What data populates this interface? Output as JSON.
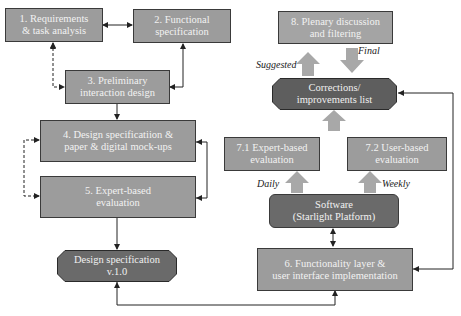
{
  "nodes": {
    "n1": {
      "line1": "1. Requirements",
      "line2": "& task analysis"
    },
    "n2": {
      "line1": "2. Functional",
      "line2": "specification"
    },
    "n3": {
      "line1": "3. Preliminary",
      "line2": "interaction design"
    },
    "n4": {
      "line1": "4. Design specificatiion &",
      "line2": "paper & digital mock-ups"
    },
    "n5": {
      "line1": "5. Expert-based",
      "line2": "evaluation"
    },
    "design_spec": {
      "line1": "Design specification",
      "line2": "v.1.0"
    },
    "n8": {
      "line1": "8. Plenary discussion",
      "line2": "and filtering"
    },
    "corrections": {
      "line1": "Corrections/",
      "line2": "improvements list"
    },
    "n71": {
      "line1": "7.1 Expert-based",
      "line2": "evaluation"
    },
    "n72": {
      "line1": "7.2 User-based",
      "line2": "evaluation"
    },
    "software": {
      "line1": "Software",
      "line2": "(Starlight Platform)"
    },
    "n6": {
      "line1": "6. Functionality layer &",
      "line2": "user interface implementation"
    }
  },
  "labels": {
    "suggested": "Suggested",
    "final": "Final",
    "daily": "Daily",
    "weekly": "Weekly"
  },
  "colors": {
    "box_fill": "#9c9c9c",
    "dark_fill": "#6a6a6a",
    "block_arrow": "#a8a8a8",
    "line": "#222222"
  }
}
